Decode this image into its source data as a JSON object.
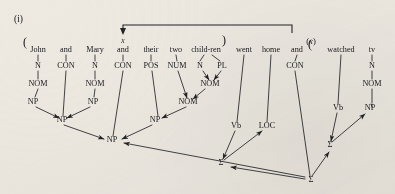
{
  "figure": {
    "label": "(i)",
    "sentence": "John and Mary and their two child-ren went home and watched tv"
  },
  "brackets": {
    "open_paren_left": "(",
    "close_paren_mid": ")",
    "open_paren_right": "(",
    "x_variable": "x",
    "x_variable_parenthesized_open": "(",
    "x_variable_parenthesized_close": ")",
    "x_variable_parenthesized": "x"
  },
  "words": [
    {
      "text": "John",
      "x": 38,
      "y": 52
    },
    {
      "text": "and",
      "x": 66,
      "y": 52
    },
    {
      "text": "Mary",
      "x": 95,
      "y": 52
    },
    {
      "text": "and",
      "x": 123,
      "y": 52
    },
    {
      "text": "their",
      "x": 151,
      "y": 52
    },
    {
      "text": "two",
      "x": 176,
      "y": 52
    },
    {
      "text": "child-ren",
      "x": 206,
      "y": 52
    },
    {
      "text": "went",
      "x": 244,
      "y": 52
    },
    {
      "text": "home",
      "x": 271,
      "y": 52
    },
    {
      "text": "and",
      "x": 297,
      "y": 52
    },
    {
      "text": "watched",
      "x": 341,
      "y": 52
    },
    {
      "text": "tv",
      "x": 372,
      "y": 52
    }
  ],
  "category_row": [
    {
      "text": "N",
      "x": 38,
      "y": 68
    },
    {
      "text": "CON",
      "x": 66,
      "y": 68
    },
    {
      "text": "N",
      "x": 95,
      "y": 68
    },
    {
      "text": "CON",
      "x": 123,
      "y": 68
    },
    {
      "text": "POS",
      "x": 151,
      "y": 68
    },
    {
      "text": "NUM",
      "x": 177,
      "y": 68
    },
    {
      "text": "N",
      "x": 200,
      "y": 68
    },
    {
      "text": "PL",
      "x": 222,
      "y": 68
    },
    {
      "text": "CON",
      "x": 295,
      "y": 68
    },
    {
      "text": "N",
      "x": 372,
      "y": 68
    }
  ],
  "nom_row": [
    {
      "text": "NOM",
      "x": 38,
      "y": 86
    },
    {
      "text": "NOM",
      "x": 95,
      "y": 86
    },
    {
      "text": "NOM",
      "x": 210,
      "y": 86
    },
    {
      "text": "NOM",
      "x": 372,
      "y": 86
    }
  ],
  "np_upper_row": [
    {
      "text": "NP",
      "x": 33,
      "y": 104
    },
    {
      "text": "NP",
      "x": 93,
      "y": 104
    },
    {
      "text": "NOM",
      "x": 188,
      "y": 104
    }
  ],
  "np_mid_row": [
    {
      "text": "NP",
      "x": 62,
      "y": 122
    },
    {
      "text": "NP",
      "x": 155,
      "y": 122
    }
  ],
  "np_root": {
    "text": "NP",
    "x": 112,
    "y": 142
  },
  "verb_row": [
    {
      "text": "Vb",
      "x": 236,
      "y": 128
    },
    {
      "text": "LOC",
      "x": 267,
      "y": 128
    },
    {
      "text": "Vb",
      "x": 338,
      "y": 110
    },
    {
      "text": "NP",
      "x": 370,
      "y": 110
    }
  ],
  "sigma_nodes": [
    {
      "text": "Σ",
      "x": 221,
      "y": 165
    },
    {
      "text": "Σ",
      "x": 330,
      "y": 147
    },
    {
      "text": "Σ",
      "x": 311,
      "y": 182
    }
  ],
  "colors": {
    "ink": "#232327",
    "paper": "#eeeae2"
  }
}
